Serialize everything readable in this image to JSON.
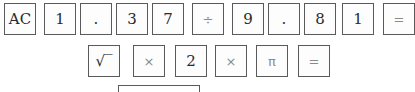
{
  "row1": [
    {
      "label": "AC",
      "name": "clear-key",
      "x": 4,
      "w": 32,
      "cls": "ac"
    },
    {
      "label": "1",
      "name": "digit-1-key",
      "x": 44,
      "w": 32,
      "cls": ""
    },
    {
      "label": ".",
      "name": "decimal-key",
      "x": 80,
      "w": 32,
      "cls": ""
    },
    {
      "label": "3",
      "name": "digit-3-key",
      "x": 116,
      "w": 32,
      "cls": ""
    },
    {
      "label": "7",
      "name": "digit-7-key",
      "x": 152,
      "w": 32,
      "cls": ""
    },
    {
      "label": "÷",
      "name": "divide-key",
      "x": 192,
      "w": 32,
      "cls": "op"
    },
    {
      "label": "9",
      "name": "digit-9-key",
      "x": 232,
      "w": 32,
      "cls": ""
    },
    {
      "label": ".",
      "name": "decimal-key",
      "x": 268,
      "w": 32,
      "cls": ""
    },
    {
      "label": "8",
      "name": "digit-8-key",
      "x": 304,
      "w": 32,
      "cls": ""
    },
    {
      "label": "1",
      "name": "digit-1-key",
      "x": 342,
      "w": 32,
      "cls": ""
    },
    {
      "label": "=",
      "name": "equals-key",
      "x": 383,
      "w": 32,
      "cls": "op"
    }
  ],
  "row2": [
    {
      "label": "√‾",
      "name": "square-root-key",
      "x": 88,
      "w": 32,
      "cls": ""
    },
    {
      "label": "×",
      "name": "multiply-key",
      "x": 133,
      "w": 32,
      "cls": "op"
    },
    {
      "label": "2",
      "name": "digit-2-key",
      "x": 175,
      "w": 32,
      "cls": ""
    },
    {
      "label": "×",
      "name": "multiply-key",
      "x": 215,
      "w": 32,
      "cls": "op"
    },
    {
      "label": "π",
      "name": "pi-key",
      "x": 256,
      "w": 32,
      "cls": "op"
    },
    {
      "label": "=",
      "name": "equals-key",
      "x": 298,
      "w": 32,
      "cls": "op"
    }
  ],
  "answer": {
    "value": ""
  }
}
